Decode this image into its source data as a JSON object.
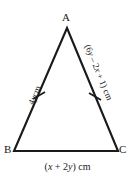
{
  "figure": {
    "type": "isosceles-triangle-diagram",
    "background_color": "#ffffff",
    "stroke_color": "#1a1a1a",
    "vertices": {
      "apex": "A",
      "bottom_left": "B",
      "bottom_right": "C"
    },
    "coordinates": {
      "A": [
        67,
        28
      ],
      "B": [
        14,
        151
      ],
      "C": [
        118,
        151
      ]
    },
    "tick_marks": {
      "count_per_equal_side": 1,
      "sides_marked": [
        "AB",
        "AC"
      ]
    },
    "labels": {
      "side_ab": "4y cm",
      "side_ab_parts": {
        "coefficient": "4",
        "variable": "y",
        "unit": "cm"
      },
      "side_ac": "(6y – 2x + 1) cm",
      "side_ac_parts": {
        "open": "(6",
        "var1": "y",
        "mid": " – 2",
        "var2": "x",
        "close": " + 1) cm"
      },
      "side_bc": "(x + 2y) cm",
      "side_bc_parts": {
        "open": "(",
        "var1": "x",
        "mid": " + 2",
        "var2": "y",
        "close": ") cm"
      }
    }
  }
}
